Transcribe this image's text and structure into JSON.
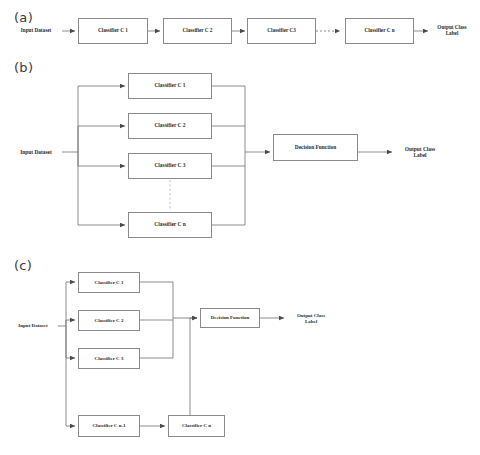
{
  "figure": {
    "background_color": "#ffffff",
    "line_color": "#6f6f6f",
    "box_border_color": "#8a8a8a",
    "text_color": "#2a2a2a"
  },
  "panels": [
    {
      "id": "a",
      "label": "(a)",
      "topology": "serial-cascade",
      "input_label": "Input Dataset",
      "output_label": "Output Class\nLabel",
      "nodes": [
        {
          "name": "classifier-c1",
          "label": "Classifier C 1"
        },
        {
          "name": "classifier-c2",
          "label": "Classifier C 2"
        },
        {
          "name": "classifier-c3",
          "label": "Classifier C3"
        },
        {
          "name": "classifier-cn",
          "label": "Classifier C n"
        }
      ],
      "has_dotted_continuation": true
    },
    {
      "id": "b",
      "label": "(b)",
      "topology": "parallel-ensemble",
      "input_label": "Input Dataset",
      "output_label": "Output Class\nLabel",
      "combiner_label": "Decision Function",
      "nodes": [
        {
          "name": "classifier-c1",
          "label": "Classifier C 1"
        },
        {
          "name": "classifier-c2",
          "label": "Classifier C 2"
        },
        {
          "name": "classifier-c3",
          "label": "Classifier C 3"
        },
        {
          "name": "classifier-cn",
          "label": "Classifier C n"
        }
      ],
      "has_dotted_continuation": true
    },
    {
      "id": "c",
      "label": "(c)",
      "topology": "hybrid-parallel-serial",
      "input_label": "Input Dataset",
      "output_label": "Output Class\nLabel",
      "combiner_label": "Decision Function",
      "nodes": [
        {
          "name": "classifier-c1",
          "label": "Classifier C 1"
        },
        {
          "name": "classifier-c2",
          "label": "Classifier C 2"
        },
        {
          "name": "classifier-c3",
          "label": "Classifier C 3"
        },
        {
          "name": "classifier-cn-1",
          "label": "Classifier C n-1"
        },
        {
          "name": "classifier-cn",
          "label": "Classifier C n"
        }
      ],
      "has_dotted_continuation": false
    }
  ]
}
